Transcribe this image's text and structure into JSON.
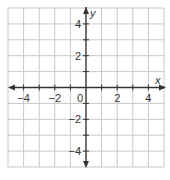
{
  "figure": {
    "type": "coordinate-plane",
    "x_axis": {
      "label": "x",
      "min": -5,
      "max": 5,
      "tick_labels": [
        "−4",
        "−2",
        "0",
        "2",
        "4"
      ],
      "tick_values": [
        -4,
        -2,
        0,
        2,
        4
      ]
    },
    "y_axis": {
      "label": "y",
      "min": -5,
      "max": 5,
      "tick_labels": [
        "4",
        "2",
        "−2",
        "−4"
      ],
      "tick_values": [
        4,
        2,
        -2,
        -4
      ]
    },
    "origin_label": "0",
    "grid": {
      "step": 1,
      "color": "#c8c8c8"
    },
    "axis_color": "#333333"
  }
}
